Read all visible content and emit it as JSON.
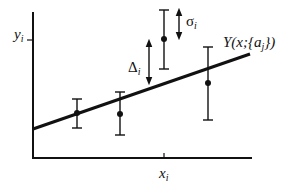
{
  "diagram": {
    "type": "least-squares-fit-illustration",
    "axes": {
      "y_label": "y",
      "y_label_sub": "i",
      "x_label": "x",
      "x_label_sub": "i"
    },
    "fit_curve": {
      "label_prefix": "Y(x;{a",
      "label_sub": "j",
      "label_suffix": "})"
    },
    "annotations": {
      "delta_symbol": "Δ",
      "delta_sub": "i",
      "sigma_symbol": "σ",
      "sigma_sub": "i"
    },
    "data_points": [
      {
        "x": 77,
        "y": 113,
        "err_top": 99,
        "err_bottom": 128
      },
      {
        "x": 120,
        "y": 114,
        "err_top": 92,
        "err_bottom": 135
      },
      {
        "x": 164,
        "y": 39,
        "err_top": 10,
        "err_bottom": 69
      },
      {
        "x": 208,
        "y": 83,
        "err_top": 47,
        "err_bottom": 120
      }
    ],
    "colors": {
      "ink": "#111111",
      "background": "#ffffff"
    }
  }
}
